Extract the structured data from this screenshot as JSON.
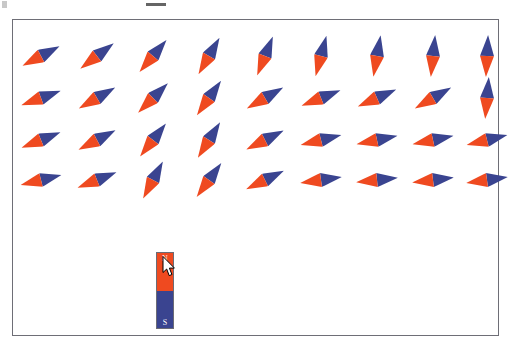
{
  "app": {
    "title": "Magnet and Compass Field Simulation",
    "panel_name": "magnetic-field-canvas"
  },
  "artifacts": {
    "top_left_mark": "",
    "top_dash_mark": ""
  },
  "magnet": {
    "name": "bar-magnet",
    "north_label": "N",
    "south_label": "S",
    "north_color": "#ef4a20",
    "south_color": "#3a4490",
    "x": 143,
    "y": 232,
    "width": 18,
    "height": 77,
    "orientation": "vertical"
  },
  "cursor": {
    "name": "mouse-pointer",
    "x": 149,
    "y": 236,
    "kind": "arrow"
  },
  "needle_style": {
    "north_color": "#ef4a20",
    "south_color": "#3a4490",
    "length": 42,
    "width": 14
  },
  "field_grid": {
    "rows": 4,
    "cols": 9,
    "col_x": [
      28,
      84,
      140,
      196,
      252,
      308,
      364,
      420,
      474
    ],
    "row_y": [
      36,
      78,
      120,
      160
    ],
    "description": "Grid of compass needles showing magnetic field direction around a vertical bar magnet. North (orange) tip points along the local field line.",
    "needles": [
      {
        "row": 0,
        "col": 0,
        "x": 28,
        "y": 36,
        "angle": 152
      },
      {
        "row": 0,
        "col": 1,
        "x": 84,
        "y": 36,
        "angle": 143
      },
      {
        "row": 0,
        "col": 2,
        "x": 140,
        "y": 36,
        "angle": 130
      },
      {
        "row": 0,
        "col": 3,
        "x": 196,
        "y": 36,
        "angle": 120
      },
      {
        "row": 0,
        "col": 4,
        "x": 252,
        "y": 36,
        "angle": 112
      },
      {
        "row": 0,
        "col": 5,
        "x": 308,
        "y": 36,
        "angle": 105
      },
      {
        "row": 0,
        "col": 6,
        "x": 364,
        "y": 36,
        "angle": 100
      },
      {
        "row": 0,
        "col": 7,
        "x": 420,
        "y": 36,
        "angle": 96
      },
      {
        "row": 0,
        "col": 8,
        "x": 474,
        "y": 36,
        "angle": 93
      },
      {
        "row": 1,
        "col": 0,
        "x": 28,
        "y": 78,
        "angle": 160
      },
      {
        "row": 1,
        "col": 1,
        "x": 84,
        "y": 78,
        "angle": 150
      },
      {
        "row": 1,
        "col": 2,
        "x": 140,
        "y": 78,
        "angle": 135
      },
      {
        "row": 1,
        "col": 3,
        "x": 196,
        "y": 78,
        "angle": 125
      },
      {
        "row": 1,
        "col": 4,
        "x": 252,
        "y": 78,
        "angle": 150
      },
      {
        "row": 1,
        "col": 5,
        "x": 308,
        "y": 78,
        "angle": 158
      },
      {
        "row": 1,
        "col": 6,
        "x": 364,
        "y": 78,
        "angle": 156
      },
      {
        "row": 1,
        "col": 7,
        "x": 420,
        "y": 78,
        "angle": 150
      },
      {
        "row": 1,
        "col": 8,
        "x": 474,
        "y": 78,
        "angle": 95
      },
      {
        "row": 2,
        "col": 0,
        "x": 28,
        "y": 120,
        "angle": 158
      },
      {
        "row": 2,
        "col": 1,
        "x": 84,
        "y": 120,
        "angle": 152
      },
      {
        "row": 2,
        "col": 2,
        "x": 140,
        "y": 120,
        "angle": 128
      },
      {
        "row": 2,
        "col": 3,
        "x": 196,
        "y": 120,
        "angle": 122
      },
      {
        "row": 2,
        "col": 4,
        "x": 252,
        "y": 120,
        "angle": 153
      },
      {
        "row": 2,
        "col": 5,
        "x": 308,
        "y": 120,
        "angle": 166
      },
      {
        "row": 2,
        "col": 6,
        "x": 364,
        "y": 120,
        "angle": 168
      },
      {
        "row": 2,
        "col": 7,
        "x": 420,
        "y": 120,
        "angle": 168
      },
      {
        "row": 2,
        "col": 8,
        "x": 474,
        "y": 120,
        "angle": 166
      },
      {
        "row": 3,
        "col": 0,
        "x": 28,
        "y": 160,
        "angle": 166
      },
      {
        "row": 3,
        "col": 1,
        "x": 84,
        "y": 160,
        "angle": 158
      },
      {
        "row": 3,
        "col": 2,
        "x": 140,
        "y": 160,
        "angle": 118
      },
      {
        "row": 3,
        "col": 3,
        "x": 196,
        "y": 160,
        "angle": 126
      },
      {
        "row": 3,
        "col": 4,
        "x": 252,
        "y": 160,
        "angle": 154
      },
      {
        "row": 3,
        "col": 5,
        "x": 308,
        "y": 160,
        "angle": 172
      },
      {
        "row": 3,
        "col": 6,
        "x": 364,
        "y": 160,
        "angle": 174
      },
      {
        "row": 3,
        "col": 7,
        "x": 420,
        "y": 160,
        "angle": 173
      },
      {
        "row": 3,
        "col": 8,
        "x": 474,
        "y": 160,
        "angle": 172
      }
    ]
  }
}
